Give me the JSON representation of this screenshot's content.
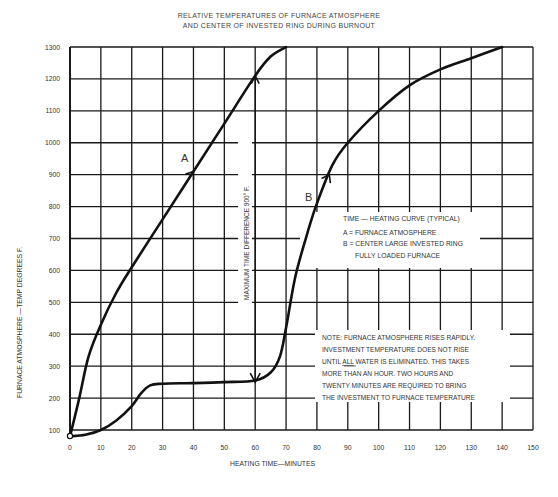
{
  "chart_data": {
    "type": "line",
    "title": "RELATIVE TEMPERATURES OF FURNACE ATMOSPHERE",
    "subtitle": "AND CENTER OF INVESTED RING DURING BURNOUT",
    "xlabel": "HEATING TIME—MINUTES",
    "ylabel": "FURNACE ATMOSPHERE —TEMP DEGREES F.",
    "xlim": [
      0,
      150
    ],
    "ylim": [
      100,
      1300
    ],
    "grid": true,
    "x_ticks": [
      0,
      10,
      20,
      30,
      40,
      50,
      60,
      70,
      80,
      90,
      100,
      110,
      120,
      130,
      140,
      150
    ],
    "x_tick_labels": [
      "0",
      "10",
      "20",
      "30",
      "40",
      "50",
      "60",
      "70",
      "80",
      "90",
      "100",
      "110",
      "120",
      "130",
      "140",
      "150"
    ],
    "y_ticks": [
      100,
      200,
      300,
      400,
      500,
      600,
      700,
      800,
      900,
      1000,
      1100,
      1200,
      1300
    ],
    "y_tick_labels": [
      "100",
      "200",
      "300",
      "400",
      "500",
      "600",
      "700",
      "800",
      "900",
      "1000",
      "1100",
      "1200",
      "1300"
    ],
    "series": [
      {
        "name": "A",
        "label": "A = FURNACE ATMOSPHERE",
        "x": [
          0,
          3,
          6,
          10,
          15,
          20,
          30,
          40,
          50,
          60,
          65,
          70
        ],
        "y": [
          80,
          200,
          330,
          430,
          530,
          610,
          760,
          910,
          1060,
          1210,
          1270,
          1300
        ]
      },
      {
        "name": "B",
        "label": "B = CENTER LARGE INVESTED RING FULLY LOADED FURNACE",
        "x": [
          0,
          5,
          10,
          15,
          20,
          23,
          26,
          30,
          40,
          50,
          60,
          65,
          68,
          70,
          73,
          77,
          80,
          85,
          90,
          100,
          110,
          120,
          130,
          140
        ],
        "y": [
          80,
          85,
          100,
          130,
          175,
          215,
          240,
          245,
          247,
          250,
          255,
          280,
          330,
          420,
          580,
          720,
          810,
          930,
          1000,
          1100,
          1180,
          1230,
          1265,
          1300
        ]
      }
    ],
    "annotations": [
      {
        "text": "A",
        "x": 40,
        "y": 910,
        "note": "arrow on curve A"
      },
      {
        "text": "B",
        "x": 84,
        "y": 900,
        "note": "arrow on curve B"
      },
      {
        "text": "MAXIMUM TIME DIFFERENCE 900° F.",
        "x": 60,
        "y_from": 250,
        "y_to": 1210,
        "note": "vertical double arrow at 60 min"
      }
    ],
    "legend": {
      "title": "TIME — HEATING CURVE (TYPICAL)",
      "lines": [
        "A = FURNACE ATMOSPHERE",
        "B = CENTER LARGE INVESTED RING",
        "FULLY LOADED FURNACE"
      ],
      "position": "right-middle"
    },
    "note": {
      "lines": [
        "NOTE: FURNACE ATMOSPHERE RISES RAPIDLY.",
        "INVESTMENT TEMPERATURE DOES NOT RISE",
        "UNTIL ALL WATER IS ELIMINATED. THIS TAKES",
        "MORE THAN AN HOUR. TWO HOURS AND",
        "TWENTY MINUTES ARE REQUIRED TO BRING",
        "THE INVESTMENT TO FURNACE TEMPERATURE"
      ]
    }
  },
  "labels": {
    "title_line1": "RELATIVE TEMPERATURES OF FURNACE ATMOSPHERE",
    "title_line2": "AND CENTER OF INVESTED RING DURING BURNOUT",
    "xlabel": "HEATING TIME—MINUTES",
    "ylabel": "FURNACE ATMOSPHERE —TEMP DEGREES F.",
    "curve_a": "A",
    "curve_b": "B",
    "max_diff": "MAXIMUM TIME DIFFERENCE 900° F.",
    "legend_title": "TIME — HEATING CURVE (TYPICAL)",
    "legend_a": "A = FURNACE ATMOSPHERE",
    "legend_b": "B = CENTER LARGE INVESTED RING",
    "legend_b2": "FULLY LOADED FURNACE",
    "note_1": "NOTE: FURNACE ATMOSPHERE RISES RAPIDLY.",
    "note_2": "INVESTMENT TEMPERATURE DOES NOT RISE",
    "note_3a": "UNTIL ",
    "note_3b": "ALL",
    "note_3c": " WATER IS ELIMINATED. THIS TAKES",
    "note_4": "MORE THAN AN HOUR. TWO HOURS AND",
    "note_5": "TWENTY MINUTES ARE REQUIRED TO BRING",
    "note_6": "THE INVESTMENT TO FURNACE TEMPERATURE"
  },
  "colors": {
    "line": "#111111",
    "grid": "#1a1a1a",
    "text": "#333333",
    "background": "#ffffff"
  }
}
